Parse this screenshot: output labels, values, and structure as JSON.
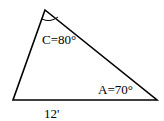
{
  "diagram": {
    "type": "triangle",
    "vertices": {
      "C": {
        "x": 45,
        "y": 10
      },
      "B": {
        "x": 13,
        "y": 100
      },
      "A": {
        "x": 157,
        "y": 100
      }
    },
    "angle_C_label": "C=80°",
    "angle_A_label": "A=70°",
    "side_label": "12'",
    "stroke_color": "#000000"
  }
}
